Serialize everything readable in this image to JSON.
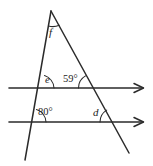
{
  "figure": {
    "kind": "geometry-diagram",
    "stroke_color": "#2b2b2b",
    "background_color": "#ffffff",
    "labels": {
      "f": "f",
      "e": "e",
      "angle_59": "59°",
      "angle_80": "80°",
      "d": "d"
    },
    "parallel_lines": [
      {
        "name": "upper-parallel-line",
        "y": 88,
        "x_start": 9,
        "x_end": 145,
        "arrow": "right"
      },
      {
        "name": "lower-parallel-line",
        "y": 122,
        "x_start": 9,
        "x_end": 145,
        "arrow": "right"
      }
    ],
    "transversals": [
      {
        "name": "left-transversal",
        "x1": 51,
        "y1": 11,
        "x2": 25,
        "y2": 160
      },
      {
        "name": "right-transversal",
        "x1": 51,
        "y1": 11,
        "x2": 129,
        "y2": 153
      }
    ],
    "angles": [
      {
        "name": "angle-f",
        "label": "f",
        "vertex_x": 51,
        "vertex_y": 11,
        "known": false
      },
      {
        "name": "angle-e",
        "label": "e",
        "vertex_x": 40,
        "vertex_y": 88,
        "known": false
      },
      {
        "name": "angle-59",
        "label": "59°",
        "vertex_x": 92,
        "vertex_y": 88,
        "known": true,
        "value": 59
      },
      {
        "name": "angle-80",
        "label": "80°",
        "vertex_x": 32,
        "vertex_y": 122,
        "known": true,
        "value": 80
      },
      {
        "name": "angle-d",
        "label": "d",
        "vertex_x": 113,
        "vertex_y": 122,
        "known": false
      }
    ]
  }
}
